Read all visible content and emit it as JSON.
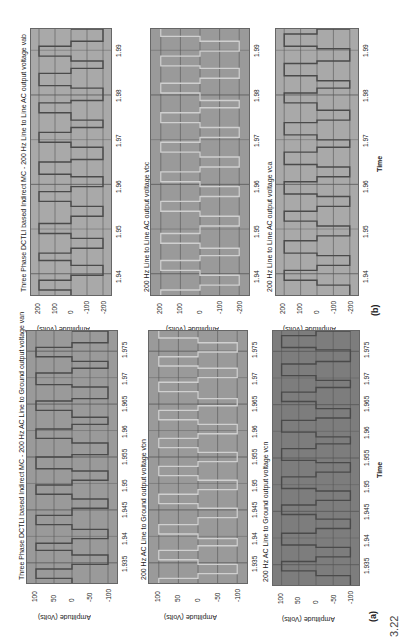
{
  "figure": {
    "panel_a_label": "(a)",
    "panel_b_label": "(b)",
    "time_label": "Time",
    "amplitude_label": "Amplitude (Volts)",
    "caption_fragment": "3.22"
  },
  "colors": {
    "plot_bg_light": "#a9a9a9",
    "plot_bg_mid": "#9a9a9a",
    "plot_bg_dark": "#7d7d7d",
    "trace_dark": "#4a4a4a",
    "trace_light": "#d0d0d0",
    "grid": "#555555"
  },
  "chart_data": [
    {
      "type": "line",
      "panel": "b",
      "title": "Three Phase DCTLI based Indirect MC - 200 Hz Line to Line AC output voltage vab",
      "xlabel": "",
      "ylabel": "Amplitude (Volts)",
      "x_ticks": [
        "1.94",
        "1.95",
        "1.96",
        "1.97",
        "1.98",
        "1.99"
      ],
      "y_ticks": [
        "200",
        "100",
        "0",
        "-100",
        "-200"
      ],
      "xlim": [
        1.935,
        1.995
      ],
      "ylim": [
        -250,
        250
      ],
      "series": [
        {
          "name": "vab",
          "description": "multilevel stepped line-to-line voltage, levels ±200, ±100, 0"
        }
      ]
    },
    {
      "type": "line",
      "panel": "b",
      "title": "200 Hz Line to Line AC output voltage vbc",
      "xlabel": "",
      "ylabel": "Amplitude (Volts)",
      "x_ticks": [
        "1.94",
        "1.95",
        "1.96",
        "1.97",
        "1.98",
        "1.99"
      ],
      "y_ticks": [
        "200",
        "100",
        "0",
        "-100",
        "-200"
      ],
      "xlim": [
        1.935,
        1.995
      ],
      "ylim": [
        -250,
        250
      ],
      "series": [
        {
          "name": "vbc",
          "description": "multilevel stepped line-to-line voltage, levels ±200, ±100, 0"
        }
      ]
    },
    {
      "type": "line",
      "panel": "b",
      "title": "200 Hz Line to Line AC output voltage vca",
      "xlabel": "Time",
      "ylabel": "Amplitude (Volts)",
      "x_ticks": [
        "1.94",
        "1.95",
        "1.96",
        "1.97",
        "1.98",
        "1.99"
      ],
      "y_ticks": [
        "200",
        "100",
        "0",
        "-100",
        "-200"
      ],
      "xlim": [
        1.935,
        1.995
      ],
      "ylim": [
        -250,
        250
      ],
      "series": [
        {
          "name": "vca",
          "description": "multilevel stepped line-to-line voltage, levels ±200, ±100, 0"
        }
      ]
    },
    {
      "type": "line",
      "panel": "a",
      "title": "Three Phase DCTLI based Indirect MC - 200 Hz AC Line to Ground output voltage van",
      "xlabel": "",
      "ylabel": "Amplitude (Volts)",
      "x_ticks": [
        "1.935",
        "1.94",
        "1.945",
        "1.95",
        "1.955",
        "1.96",
        "1.965",
        "1.97",
        "1.975"
      ],
      "y_ticks": [
        "100",
        "50",
        "0",
        "-50",
        "-100"
      ],
      "xlim": [
        1.933,
        1.978
      ],
      "ylim": [
        -120,
        120
      ],
      "series": [
        {
          "name": "van",
          "description": "pulsed line-to-ground voltage, levels +100, 0, -100"
        }
      ]
    },
    {
      "type": "line",
      "panel": "a",
      "title": "200 Hz AC Line to Ground output voltage vbn",
      "xlabel": "",
      "ylabel": "Amplitude (Volts)",
      "x_ticks": [
        "1.935",
        "1.94",
        "1.945",
        "1.95",
        "1.955",
        "1.96",
        "1.965",
        "1.97",
        "1.975"
      ],
      "y_ticks": [
        "100",
        "50",
        "0",
        "-50",
        "-100"
      ],
      "xlim": [
        1.933,
        1.978
      ],
      "ylim": [
        -120,
        120
      ],
      "series": [
        {
          "name": "vbn",
          "description": "pulsed line-to-ground voltage, levels +100, 0, -100"
        }
      ]
    },
    {
      "type": "line",
      "panel": "a",
      "title": "200 Hz AC Line to Ground output voltage vcn",
      "xlabel": "Time",
      "ylabel": "Amplitude (Volts)",
      "x_ticks": [
        "1.935",
        "1.94",
        "1.945",
        "1.95",
        "1.955",
        "1.96",
        "1.965",
        "1.97",
        "1.975"
      ],
      "y_ticks": [
        "100",
        "50",
        "0",
        "-50",
        "-100"
      ],
      "xlim": [
        1.933,
        1.978
      ],
      "ylim": [
        -120,
        120
      ],
      "series": [
        {
          "name": "vcn",
          "description": "pulsed line-to-ground voltage, levels +100, 0, -100"
        }
      ]
    }
  ]
}
